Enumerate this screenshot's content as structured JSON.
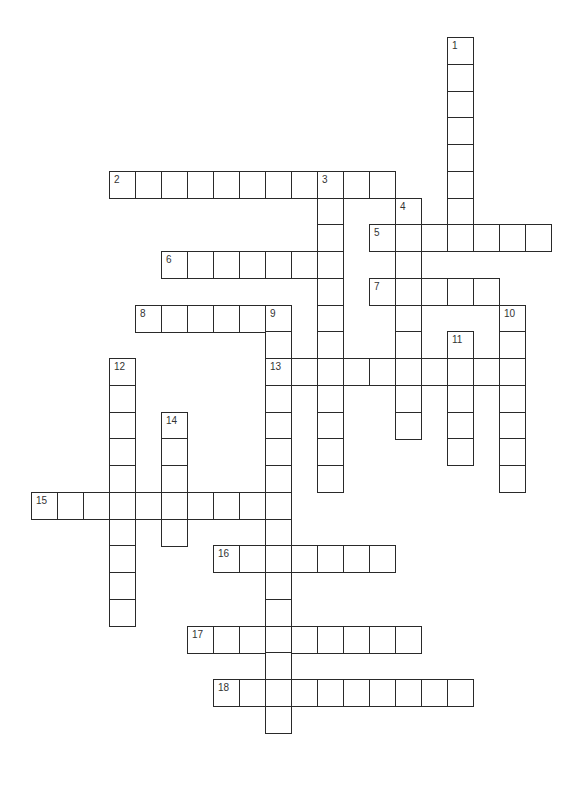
{
  "puzzle": {
    "type": "crossword",
    "grid": {
      "origin_x": 31,
      "origin_y": 37,
      "cell_w": 26,
      "cell_h": 26.75
    },
    "colors": {
      "line": "#2a2a2a",
      "number": "#333333",
      "background": "#ffffff"
    },
    "words": [
      {
        "number": "1",
        "direction": "down",
        "row": 0,
        "col": 16,
        "length": 8
      },
      {
        "number": "2",
        "direction": "across",
        "row": 5,
        "col": 3,
        "length": 11
      },
      {
        "number": "3",
        "direction": "down",
        "row": 5,
        "col": 11,
        "length": 12
      },
      {
        "number": "4",
        "direction": "down",
        "row": 6,
        "col": 14,
        "length": 9
      },
      {
        "number": "5",
        "direction": "across",
        "row": 7,
        "col": 13,
        "length": 7
      },
      {
        "number": "6",
        "direction": "across",
        "row": 8,
        "col": 5,
        "length": 7
      },
      {
        "number": "7",
        "direction": "across",
        "row": 9,
        "col": 13,
        "length": 5
      },
      {
        "number": "8",
        "direction": "across",
        "row": 10,
        "col": 4,
        "length": 6
      },
      {
        "number": "9",
        "direction": "down",
        "row": 10,
        "col": 9,
        "length": 16
      },
      {
        "number": "10",
        "direction": "down",
        "row": 10,
        "col": 18,
        "length": 7
      },
      {
        "number": "11",
        "direction": "down",
        "row": 11,
        "col": 16,
        "length": 5
      },
      {
        "number": "12",
        "direction": "down",
        "row": 12,
        "col": 3,
        "length": 10
      },
      {
        "number": "13",
        "direction": "across",
        "row": 12,
        "col": 9,
        "length": 10
      },
      {
        "number": "14",
        "direction": "down",
        "row": 14,
        "col": 5,
        "length": 5
      },
      {
        "number": "15",
        "direction": "across",
        "row": 17,
        "col": 0,
        "length": 10
      },
      {
        "number": "16",
        "direction": "across",
        "row": 19,
        "col": 7,
        "length": 7
      },
      {
        "number": "17",
        "direction": "across",
        "row": 22,
        "col": 6,
        "length": 9
      },
      {
        "number": "18",
        "direction": "across",
        "row": 24,
        "col": 7,
        "length": 10
      }
    ]
  }
}
